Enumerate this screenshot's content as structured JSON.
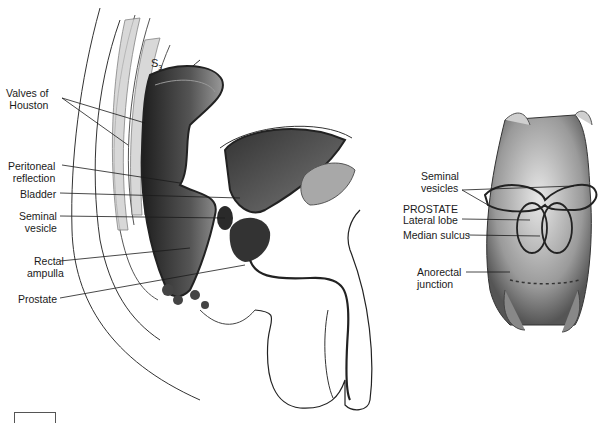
{
  "figure": {
    "left_panel": {
      "name": "sagittal-section-male-pelvis",
      "vertebra_label": "S",
      "vertebra_subscript": "3",
      "labels": [
        {
          "id": "valves-of-houston",
          "line1": "Valves of",
          "line2": "Houston"
        },
        {
          "id": "peritoneal-reflection",
          "line1": "Peritoneal",
          "line2": "reflection"
        },
        {
          "id": "bladder",
          "line1": "Bladder",
          "line2": ""
        },
        {
          "id": "seminal-vesicle",
          "line1": "Seminal",
          "line2": "vesicle"
        },
        {
          "id": "rectal-ampulla",
          "line1": "Rectal",
          "line2": "ampulla"
        },
        {
          "id": "prostate",
          "line1": "Prostate",
          "line2": ""
        }
      ]
    },
    "right_panel": {
      "name": "posterior-view-rectum-prostate",
      "labels": [
        {
          "id": "seminal-vesicles",
          "line1": "Seminal",
          "line2": "vesicles"
        },
        {
          "id": "prostate-heading",
          "line1": "PROSTATE",
          "line2": ""
        },
        {
          "id": "lateral-lobe",
          "line1": "Lateral lobe",
          "line2": ""
        },
        {
          "id": "median-sulcus",
          "line1": "Median sulcus",
          "line2": ""
        },
        {
          "id": "anorectal-junction",
          "line1": "Anorectal",
          "line2": "junction"
        }
      ]
    },
    "colors": {
      "ink": "#1a1a1a",
      "dark_tissue": "#3a3a3a",
      "mid_tissue": "#8a8a8a",
      "light_tissue": "#c8c8c8"
    }
  }
}
